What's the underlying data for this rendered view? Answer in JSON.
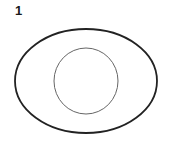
{
  "figure": {
    "label": "1",
    "outer_ellipse": {
      "cx": 86,
      "cy": 81,
      "rx": 71,
      "ry": 52,
      "stroke": "#222222",
      "stroke_width": 1.8
    },
    "inner_circle": {
      "cx": 86,
      "cy": 81,
      "rx": 32,
      "ry": 33,
      "stroke": "#666666",
      "stroke_width": 1
    }
  }
}
